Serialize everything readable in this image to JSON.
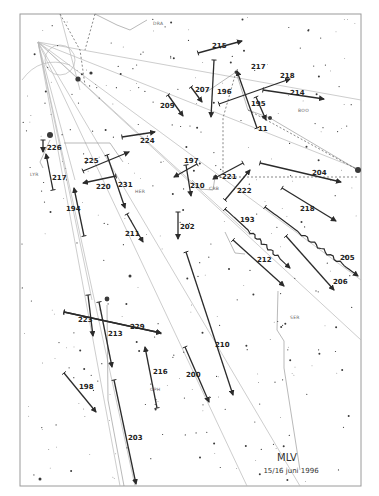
{
  "signature": {
    "observer": "MLV",
    "date": "15/16 juni 1996"
  },
  "frame": {
    "x": 20,
    "y": 14,
    "w": 341,
    "h": 472
  },
  "constellation_labels": [
    {
      "text": "DRA",
      "x": 153,
      "y": 25
    },
    {
      "text": "BOO",
      "x": 298,
      "y": 112
    },
    {
      "text": "LYR",
      "x": 30,
      "y": 176
    },
    {
      "text": "HER",
      "x": 135,
      "y": 193
    },
    {
      "text": "CRB",
      "x": 209,
      "y": 190
    },
    {
      "text": "SER",
      "x": 290,
      "y": 319
    },
    {
      "text": "OPH",
      "x": 150,
      "y": 391
    }
  ],
  "extra_labels": [
    {
      "text": "11",
      "x": 258,
      "y": 131
    }
  ],
  "meteors": [
    {
      "id": "209",
      "label": "209",
      "x1": 168,
      "y1": 95,
      "x2": 183,
      "y2": 116,
      "lx": 160,
      "ly": 108,
      "wavy": false
    },
    {
      "id": "215",
      "label": "215",
      "x1": 198,
      "y1": 53,
      "x2": 242,
      "y2": 41,
      "lx": 212,
      "ly": 48,
      "wavy": false
    },
    {
      "id": "207",
      "label": "207",
      "x1": 191,
      "y1": 87,
      "x2": 202,
      "y2": 102,
      "lx": 195,
      "ly": 92,
      "wavy": false
    },
    {
      "id": "196",
      "label": "196",
      "x1": 214,
      "y1": 60,
      "x2": 211,
      "y2": 117,
      "lx": 217,
      "ly": 94,
      "wavy": false
    },
    {
      "id": "217",
      "label": "217",
      "x1": 257,
      "y1": 128,
      "x2": 237,
      "y2": 71,
      "lx": 251,
      "ly": 69,
      "wavy": false
    },
    {
      "id": "195",
      "label": "195",
      "x1": 256,
      "y1": 97,
      "x2": 266,
      "y2": 120,
      "lx": 251,
      "ly": 106,
      "wavy": false
    },
    {
      "id": "218",
      "label": "218",
      "x1": 219,
      "y1": 104,
      "x2": 290,
      "y2": 79,
      "lx": 280,
      "ly": 78,
      "wavy": false
    },
    {
      "id": "214",
      "label": "214",
      "x1": 263,
      "y1": 90,
      "x2": 324,
      "y2": 99,
      "lx": 290,
      "ly": 95,
      "wavy": false
    },
    {
      "id": "226",
      "label": "226",
      "x1": 43,
      "y1": 140,
      "x2": 43,
      "y2": 152,
      "lx": 47,
      "ly": 150,
      "wavy": false
    },
    {
      "id": "217b",
      "label": "217",
      "x1": 53,
      "y1": 190,
      "x2": 46,
      "y2": 154,
      "lx": 52,
      "ly": 180,
      "wavy": false
    },
    {
      "id": "224",
      "label": "224",
      "x1": 122,
      "y1": 137,
      "x2": 155,
      "y2": 132,
      "lx": 140,
      "ly": 143,
      "wavy": false
    },
    {
      "id": "225",
      "label": "225",
      "x1": 83,
      "y1": 171,
      "x2": 129,
      "y2": 152,
      "lx": 84,
      "ly": 163,
      "wavy": false
    },
    {
      "id": "220",
      "label": "220",
      "x1": 116,
      "y1": 176,
      "x2": 83,
      "y2": 183,
      "lx": 96,
      "ly": 189,
      "wavy": false
    },
    {
      "id": "231",
      "label": "231",
      "x1": 107,
      "y1": 155,
      "x2": 125,
      "y2": 208,
      "lx": 118,
      "ly": 187,
      "wavy": false
    },
    {
      "id": "194",
      "label": "194",
      "x1": 84,
      "y1": 236,
      "x2": 74,
      "y2": 188,
      "lx": 66,
      "ly": 211,
      "wavy": false
    },
    {
      "id": "211",
      "label": "211",
      "x1": 127,
      "y1": 214,
      "x2": 143,
      "y2": 242,
      "lx": 125,
      "ly": 236,
      "wavy": false
    },
    {
      "id": "202",
      "label": "202",
      "x1": 178,
      "y1": 212,
      "x2": 178,
      "y2": 239,
      "lx": 180,
      "ly": 229,
      "wavy": false
    },
    {
      "id": "197",
      "label": "197",
      "x1": 197,
      "y1": 164,
      "x2": 174,
      "y2": 177,
      "lx": 184,
      "ly": 163,
      "wavy": false
    },
    {
      "id": "210b",
      "label": "210",
      "x1": 186,
      "y1": 165,
      "x2": 191,
      "y2": 196,
      "lx": 190,
      "ly": 188,
      "wavy": false
    },
    {
      "id": "221",
      "label": "221",
      "x1": 243,
      "y1": 163,
      "x2": 213,
      "y2": 179,
      "lx": 222,
      "ly": 179,
      "wavy": false
    },
    {
      "id": "222",
      "label": "222",
      "x1": 225,
      "y1": 200,
      "x2": 250,
      "y2": 170,
      "lx": 237,
      "ly": 193,
      "wavy": false
    },
    {
      "id": "204",
      "label": "204",
      "x1": 260,
      "y1": 163,
      "x2": 341,
      "y2": 182,
      "lx": 312,
      "ly": 175,
      "wavy": false
    },
    {
      "id": "218b",
      "label": "218",
      "x1": 282,
      "y1": 188,
      "x2": 336,
      "y2": 221,
      "lx": 300,
      "ly": 211,
      "wavy": false
    },
    {
      "id": "193",
      "label": "193",
      "x1": 225,
      "y1": 209,
      "x2": 290,
      "y2": 268,
      "lx": 240,
      "ly": 222,
      "wavy": true
    },
    {
      "id": "205",
      "label": "205",
      "x1": 265,
      "y1": 207,
      "x2": 358,
      "y2": 276,
      "lx": 340,
      "ly": 260,
      "wavy": true
    },
    {
      "id": "212",
      "label": "212",
      "x1": 233,
      "y1": 240,
      "x2": 284,
      "y2": 286,
      "lx": 257,
      "ly": 262,
      "wavy": false
    },
    {
      "id": "206",
      "label": "206",
      "x1": 286,
      "y1": 236,
      "x2": 334,
      "y2": 290,
      "lx": 333,
      "ly": 284,
      "wavy": false
    },
    {
      "id": "223",
      "label": "223",
      "x1": 64,
      "y1": 312,
      "x2": 161,
      "y2": 333,
      "lx": 78,
      "ly": 322,
      "wavy": false
    },
    {
      "id": "229",
      "label": "229",
      "x1": 64,
      "y1": 312,
      "x2": 161,
      "y2": 333,
      "lx": 130,
      "ly": 329,
      "wavy": false
    },
    {
      "id": "222b",
      "label": "",
      "x1": 88,
      "y1": 295,
      "x2": 93,
      "y2": 336,
      "lx": 0,
      "ly": 0,
      "wavy": false
    },
    {
      "id": "213",
      "label": "213",
      "x1": 99,
      "y1": 302,
      "x2": 112,
      "y2": 367,
      "lx": 108,
      "ly": 336,
      "wavy": false
    },
    {
      "id": "210",
      "label": "210",
      "x1": 186,
      "y1": 252,
      "x2": 233,
      "y2": 395,
      "lx": 215,
      "ly": 347,
      "wavy": false
    },
    {
      "id": "216",
      "label": "216",
      "x1": 157,
      "y1": 408,
      "x2": 145,
      "y2": 347,
      "lx": 153,
      "ly": 374,
      "wavy": false
    },
    {
      "id": "200",
      "label": "200",
      "x1": 185,
      "y1": 347,
      "x2": 209,
      "y2": 402,
      "lx": 186,
      "ly": 377,
      "wavy": false
    },
    {
      "id": "198",
      "label": "198",
      "x1": 64,
      "y1": 373,
      "x2": 96,
      "y2": 412,
      "lx": 79,
      "ly": 389,
      "wavy": false
    },
    {
      "id": "203",
      "label": "203",
      "x1": 114,
      "y1": 380,
      "x2": 136,
      "y2": 484,
      "lx": 128,
      "ly": 440,
      "wavy": false
    }
  ],
  "footer_text": "…"
}
